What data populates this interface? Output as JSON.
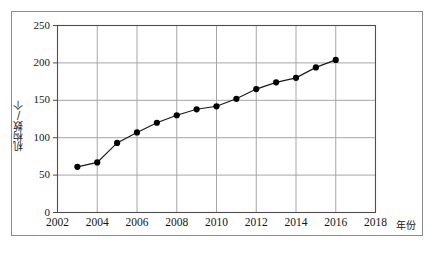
{
  "chart_data": {
    "type": "line",
    "title": "",
    "xlabel": "年份",
    "ylabel": "机构数/个",
    "x": [
      2003,
      2004,
      2005,
      2006,
      2007,
      2008,
      2009,
      2010,
      2011,
      2012,
      2013,
      2014,
      2015,
      2016
    ],
    "values": [
      61,
      67,
      93,
      107,
      120,
      130,
      138,
      142,
      152,
      165,
      174,
      180,
      194,
      204
    ],
    "series": [
      {
        "name": "机构数/个",
        "values": [
          61,
          67,
          93,
          107,
          120,
          130,
          138,
          142,
          152,
          165,
          174,
          180,
          194,
          204
        ]
      }
    ],
    "xlim": [
      2002,
      2018
    ],
    "ylim": [
      0,
      250
    ],
    "xticks": [
      "2002",
      "2004",
      "2006",
      "2008",
      "2010",
      "2012",
      "2014",
      "2016",
      "2018"
    ],
    "xtick_values": [
      2002,
      2004,
      2006,
      2008,
      2010,
      2012,
      2014,
      2016,
      2018
    ],
    "yticks": [
      "0",
      "50",
      "100",
      "150",
      "200",
      "250"
    ],
    "ytick_values": [
      0,
      50,
      100,
      150,
      200,
      250
    ],
    "grid": true,
    "legend": "none",
    "marker": "filled-circle",
    "line_color": "#1a1a1a",
    "marker_color": "#000000",
    "grid_color": "#a6a6a6",
    "axis_color": "#4d4d4d"
  },
  "caption": {
    "text": ""
  }
}
